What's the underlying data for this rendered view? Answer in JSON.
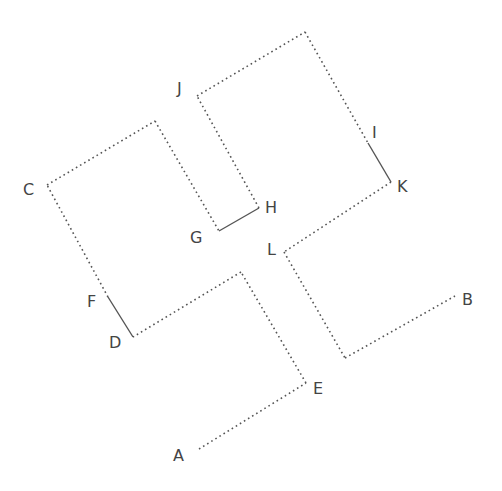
{
  "diagram": {
    "line_color": "#555555",
    "label_color": "#444444",
    "points": {
      "A": [
        199,
        449
      ],
      "E": [
        306,
        383
      ],
      "P1": [
        241,
        272
      ],
      "D": [
        133,
        337
      ],
      "F": [
        108,
        297
      ],
      "C": [
        47,
        185
      ],
      "P2": [
        155,
        121
      ],
      "G": [
        219,
        231
      ],
      "H": [
        259,
        208
      ],
      "J": [
        197,
        96
      ],
      "P3": [
        305,
        32
      ],
      "I": [
        368,
        143
      ],
      "K": [
        391,
        182
      ],
      "L": [
        284,
        252
      ],
      "P4": [
        345,
        358
      ],
      "B": [
        455,
        296
      ]
    },
    "segments": [
      {
        "from": "A",
        "to": "E",
        "style": "dotted"
      },
      {
        "from": "E",
        "to": "P1",
        "style": "dotted"
      },
      {
        "from": "P1",
        "to": "D",
        "style": "dotted"
      },
      {
        "from": "D",
        "to": "F",
        "style": "solid"
      },
      {
        "from": "F",
        "to": "C",
        "style": "dotted"
      },
      {
        "from": "C",
        "to": "P2",
        "style": "dotted"
      },
      {
        "from": "P2",
        "to": "G",
        "style": "dotted"
      },
      {
        "from": "G",
        "to": "H",
        "style": "solid"
      },
      {
        "from": "H",
        "to": "J",
        "style": "dotted"
      },
      {
        "from": "J",
        "to": "P3",
        "style": "dotted"
      },
      {
        "from": "P3",
        "to": "I",
        "style": "dotted"
      },
      {
        "from": "I",
        "to": "K",
        "style": "solid"
      },
      {
        "from": "K",
        "to": "L",
        "style": "dotted"
      },
      {
        "from": "L",
        "to": "P4",
        "style": "dotted"
      },
      {
        "from": "P4",
        "to": "B",
        "style": "dotted"
      }
    ],
    "labels": [
      {
        "text": "A",
        "x": 173,
        "y": 461
      },
      {
        "text": "B",
        "x": 462,
        "y": 305
      },
      {
        "text": "C",
        "x": 23,
        "y": 195
      },
      {
        "text": "D",
        "x": 109,
        "y": 348
      },
      {
        "text": "E",
        "x": 313,
        "y": 394
      },
      {
        "text": "F",
        "x": 87,
        "y": 307
      },
      {
        "text": "G",
        "x": 190,
        "y": 243
      },
      {
        "text": "H",
        "x": 265,
        "y": 213
      },
      {
        "text": "I",
        "x": 372,
        "y": 138
      },
      {
        "text": "J",
        "x": 177,
        "y": 94
      },
      {
        "text": "K",
        "x": 397,
        "y": 192
      },
      {
        "text": "L",
        "x": 267,
        "y": 255
      }
    ]
  }
}
